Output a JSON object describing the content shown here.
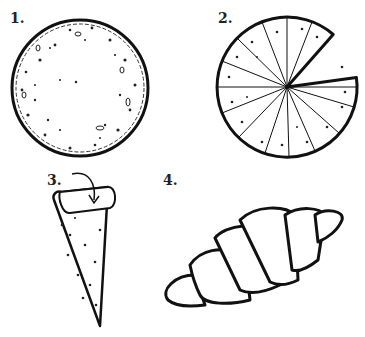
{
  "figure": {
    "steps": [
      {
        "label": "1.",
        "description": "whole round dough circle"
      },
      {
        "label": "2.",
        "description": "dough cut into wedges, one removed"
      },
      {
        "label": "3.",
        "description": "wedge rolled from wide end, arrow"
      },
      {
        "label": "4.",
        "description": "finished crescent roll"
      }
    ]
  },
  "colors": {
    "ink": "#111111",
    "background": "#ffffff"
  }
}
